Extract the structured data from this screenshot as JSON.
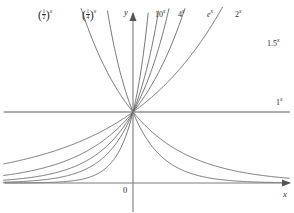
{
  "figure": {
    "background_color": "#ffffff",
    "curve_color": "#555555",
    "axis_color": "#7d7d7d"
  },
  "axes": {
    "x_axis_label": "x",
    "y_axis_label": "y",
    "origin_label": "0",
    "x_range": [
      -3.2,
      3.1
    ],
    "y_range": [
      -0.35,
      4.4
    ],
    "grid": false,
    "x_axis_pixel_y": 183,
    "y_axis_pixel_x": 133,
    "unit_line_label": "1",
    "unit_line_exponent": "x"
  },
  "chart_data": {
    "type": "line",
    "xlabel": "x",
    "ylabel": "y",
    "xlim": [
      -3.2,
      3.1
    ],
    "ylim": [
      -0.35,
      4.4
    ],
    "grid": false,
    "legend": "inline-curve-labels",
    "common_point": [
      0,
      1
    ],
    "series": [
      {
        "name": "(1/2)^x",
        "base": 0.5,
        "label_text": "(1/2)",
        "label_numerator": "1",
        "label_denominator": "2",
        "label_exponent": "x",
        "label_position": "top-left",
        "decreasing": false
      },
      {
        "name": "(1/4)^x",
        "base": 0.25,
        "label_text": "(1/4)",
        "label_numerator": "1",
        "label_denominator": "4",
        "label_exponent": "x",
        "label_position": "top-left",
        "decreasing": false
      },
      {
        "name": "10^x",
        "base": 10,
        "label_text": "10",
        "label_exponent": "x",
        "label_position": "top",
        "decreasing": false
      },
      {
        "name": "4^x",
        "base": 4,
        "label_text": "4",
        "label_exponent": "x",
        "label_position": "top",
        "decreasing": false
      },
      {
        "name": "e^x",
        "base": 2.718281828,
        "label_text": "e",
        "label_exponent": "x",
        "label_position": "top",
        "decreasing": false
      },
      {
        "name": "2^x",
        "base": 2,
        "label_text": "2",
        "label_exponent": "x",
        "label_position": "top",
        "decreasing": false
      },
      {
        "name": "1.5^x",
        "base": 1.5,
        "label_text": "1.5",
        "label_exponent": "x",
        "label_position": "right",
        "decreasing": false
      },
      {
        "name": "1^x",
        "base": 1,
        "label_text": "1",
        "label_exponent": "x",
        "label_position": "right-middle",
        "decreasing": false
      }
    ]
  },
  "labels": {
    "half": {
      "num": "1",
      "den": "2",
      "exp": "x"
    },
    "quarter": {
      "num": "1",
      "den": "4",
      "exp": "x"
    },
    "ten": {
      "base": "10",
      "exp": "x"
    },
    "four": {
      "base": "4",
      "exp": "x"
    },
    "euler": {
      "base": "e",
      "exp": "x"
    },
    "two": {
      "base": "2",
      "exp": "x"
    },
    "onepointfive": {
      "base": "1.5",
      "exp": "x"
    },
    "one": {
      "base": "1",
      "exp": "x"
    },
    "y_axis": "y",
    "x_axis": "x",
    "origin": "0"
  }
}
